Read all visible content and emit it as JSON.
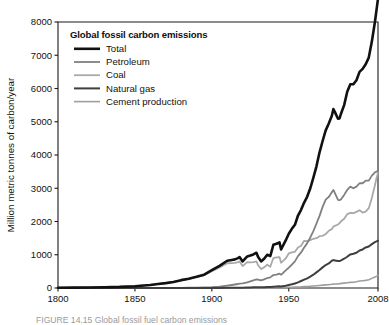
{
  "figure": {
    "caption": "FIGURE 14.15  Global fossil fuel carbon emissions"
  },
  "chart_data": {
    "type": "line",
    "title": "Global fossil carbon emissions",
    "xlabel": "",
    "ylabel": "Million metric tonnes of carbon/year",
    "xlim": [
      1800,
      2008
    ],
    "ylim": [
      0,
      8000
    ],
    "xticks": [
      1800,
      1850,
      1900,
      1950,
      2008
    ],
    "xticklabels": [
      "1800",
      "1850",
      "1900",
      "1950",
      "2008"
    ],
    "yticks": [
      0,
      1000,
      2000,
      3000,
      4000,
      5000,
      6000,
      7000,
      8000
    ],
    "yticklabels": [
      "0",
      "1000",
      "2000",
      "3000",
      "4000",
      "5000",
      "6000",
      "7000",
      "8000"
    ],
    "grid": false,
    "legend_position": "upper-left-inside",
    "colors": {
      "total": "#111111",
      "petroleum": "#808080",
      "coal": "#a9a9a9",
      "natural_gas": "#3f3f3f",
      "cement": "#9e9e9e"
    },
    "x": [
      1800,
      1810,
      1820,
      1830,
      1840,
      1850,
      1860,
      1865,
      1870,
      1875,
      1880,
      1885,
      1890,
      1895,
      1900,
      1905,
      1910,
      1913,
      1915,
      1917,
      1918,
      1920,
      1923,
      1925,
      1927,
      1929,
      1930,
      1932,
      1934,
      1936,
      1938,
      1940,
      1942,
      1944,
      1945,
      1946,
      1948,
      1950,
      1952,
      1954,
      1956,
      1958,
      1960,
      1962,
      1964,
      1966,
      1968,
      1970,
      1972,
      1974,
      1976,
      1978,
      1979,
      1980,
      1982,
      1983,
      1984,
      1986,
      1988,
      1990,
      1992,
      1994,
      1996,
      1998,
      2000,
      2002,
      2004,
      2006,
      2007,
      2008
    ],
    "series": [
      {
        "name": "Total",
        "values": [
          8,
          12,
          17,
          24,
          33,
          54,
          91,
          122,
          147,
          183,
          236,
          280,
          336,
          400,
          534,
          665,
          819,
          843,
          860,
          900,
          930,
          800,
          950,
          975,
          1010,
          1060,
          940,
          800,
          880,
          1000,
          960,
          1300,
          1330,
          1370,
          1160,
          1250,
          1430,
          1630,
          1780,
          1900,
          2180,
          2350,
          2570,
          2750,
          3000,
          3320,
          3660,
          4080,
          4420,
          4740,
          4950,
          5180,
          5380,
          5290,
          5090,
          5100,
          5250,
          5500,
          5900,
          6130,
          6130,
          6250,
          6500,
          6590,
          6730,
          6930,
          7410,
          8000,
          8350,
          8700
        ]
      },
      {
        "name": "Petroleum",
        "values": [
          0,
          0,
          0,
          0,
          0,
          0,
          0,
          0,
          1,
          2,
          4,
          7,
          11,
          16,
          25,
          40,
          70,
          90,
          105,
          120,
          130,
          140,
          170,
          200,
          230,
          260,
          250,
          230,
          260,
          300,
          320,
          390,
          400,
          430,
          400,
          440,
          530,
          610,
          700,
          800,
          960,
          1070,
          1220,
          1350,
          1520,
          1710,
          1940,
          2170,
          2440,
          2660,
          2740,
          2880,
          2950,
          2850,
          2650,
          2640,
          2670,
          2800,
          2950,
          3050,
          3000,
          3050,
          3150,
          3150,
          3230,
          3230,
          3380,
          3480,
          3500,
          3530
        ]
      },
      {
        "name": "Coal",
        "values": [
          8,
          12,
          17,
          24,
          33,
          54,
          91,
          122,
          146,
          181,
          232,
          273,
          325,
          384,
          504,
          620,
          745,
          750,
          755,
          780,
          800,
          660,
          780,
          770,
          780,
          800,
          690,
          570,
          620,
          700,
          640,
          900,
          920,
          930,
          760,
          800,
          890,
          1040,
          1070,
          1090,
          1220,
          1270,
          1420,
          1410,
          1440,
          1480,
          1500,
          1560,
          1570,
          1620,
          1720,
          1770,
          1850,
          1870,
          1910,
          1950,
          2010,
          2080,
          2220,
          2260,
          2250,
          2290,
          2340,
          2270,
          2300,
          2400,
          2710,
          3090,
          3300,
          3470
        ]
      },
      {
        "name": "Natural gas",
        "values": [
          0,
          0,
          0,
          0,
          0,
          0,
          0,
          0,
          0,
          0,
          0,
          0,
          0,
          0,
          1,
          2,
          4,
          5,
          6,
          7,
          8,
          10,
          13,
          16,
          20,
          24,
          25,
          24,
          26,
          30,
          33,
          40,
          45,
          50,
          48,
          55,
          70,
          90,
          110,
          135,
          170,
          210,
          250,
          290,
          340,
          400,
          470,
          540,
          620,
          690,
          740,
          820,
          840,
          830,
          810,
          810,
          830,
          880,
          940,
          1010,
          1030,
          1060,
          1130,
          1160,
          1220,
          1250,
          1320,
          1380,
          1400,
          1420
        ]
      },
      {
        "name": "Cement production",
        "values": [
          0,
          0,
          0,
          0,
          0,
          0,
          0,
          0,
          0,
          0,
          0,
          0,
          0,
          0,
          1,
          2,
          3,
          4,
          4,
          4,
          4,
          4,
          6,
          7,
          8,
          9,
          8,
          7,
          8,
          9,
          10,
          12,
          12,
          12,
          11,
          12,
          14,
          18,
          22,
          26,
          30,
          34,
          40,
          45,
          52,
          58,
          66,
          75,
          85,
          95,
          102,
          112,
          118,
          120,
          125,
          130,
          138,
          148,
          160,
          170,
          175,
          190,
          210,
          220,
          230,
          250,
          290,
          330,
          350,
          380
        ]
      }
    ],
    "legend": [
      {
        "label": "Total",
        "color": "#111111",
        "width": 2.6
      },
      {
        "label": "Petroleum",
        "color": "#808080",
        "width": 1.8
      },
      {
        "label": "Coal",
        "color": "#a9a9a9",
        "width": 1.8
      },
      {
        "label": "Natural gas",
        "color": "#3f3f3f",
        "width": 2.0
      },
      {
        "label": "Cement production",
        "color": "#9e9e9e",
        "width": 1.6
      }
    ]
  }
}
